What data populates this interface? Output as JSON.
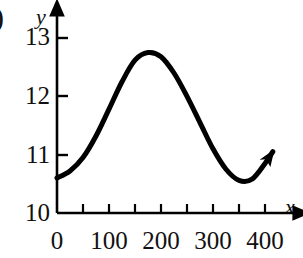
{
  "figure": {
    "panel_tag": ")",
    "background_color": "#ffffff",
    "curve_color": "#000000",
    "axis_color": "#000000"
  },
  "axes": {
    "x": {
      "name": "x",
      "tick_labels": [
        "0",
        "100",
        "200",
        "300",
        "400"
      ],
      "tick_values": [
        0,
        100,
        200,
        300,
        400
      ],
      "minor_tick_values": [
        50,
        150,
        250,
        350
      ],
      "range": [
        0,
        430
      ]
    },
    "y": {
      "name": "y",
      "tick_labels": [
        "10",
        "11",
        "12",
        "13"
      ],
      "tick_values": [
        10,
        11,
        12,
        13
      ],
      "range": [
        10,
        13.35
      ]
    }
  },
  "chart_data": {
    "type": "line",
    "title": "",
    "xlabel": "x",
    "ylabel": "y",
    "xlim": [
      0,
      430
    ],
    "ylim": [
      10,
      13.35
    ],
    "grid": false,
    "legend": null,
    "annotations": [
      {
        "text": ")",
        "note": "cut-off panel letter label at top-left"
      },
      {
        "text": "arrowhead",
        "note": "curve ends with an arrowhead pointing up-right"
      }
    ],
    "series": [
      {
        "name": "curve",
        "color": "#000000",
        "line_width": 5,
        "description": "smooth sinusoid-like curve rising from about 10.6 at x=0 to a maximum of about 12.75 near x=175, falling to a minimum of about 10.55 near x=355, then rising again to about 11.05 at x=415 where it ends in an arrowhead",
        "x": [
          0,
          25,
          50,
          75,
          100,
          125,
          150,
          175,
          200,
          225,
          250,
          275,
          300,
          325,
          350,
          375,
          400,
          415
        ],
        "y": [
          10.6,
          10.72,
          10.95,
          11.32,
          11.78,
          12.25,
          12.62,
          12.75,
          12.68,
          12.4,
          12.0,
          11.55,
          11.1,
          10.75,
          10.56,
          10.58,
          10.85,
          11.05
        ]
      }
    ]
  }
}
